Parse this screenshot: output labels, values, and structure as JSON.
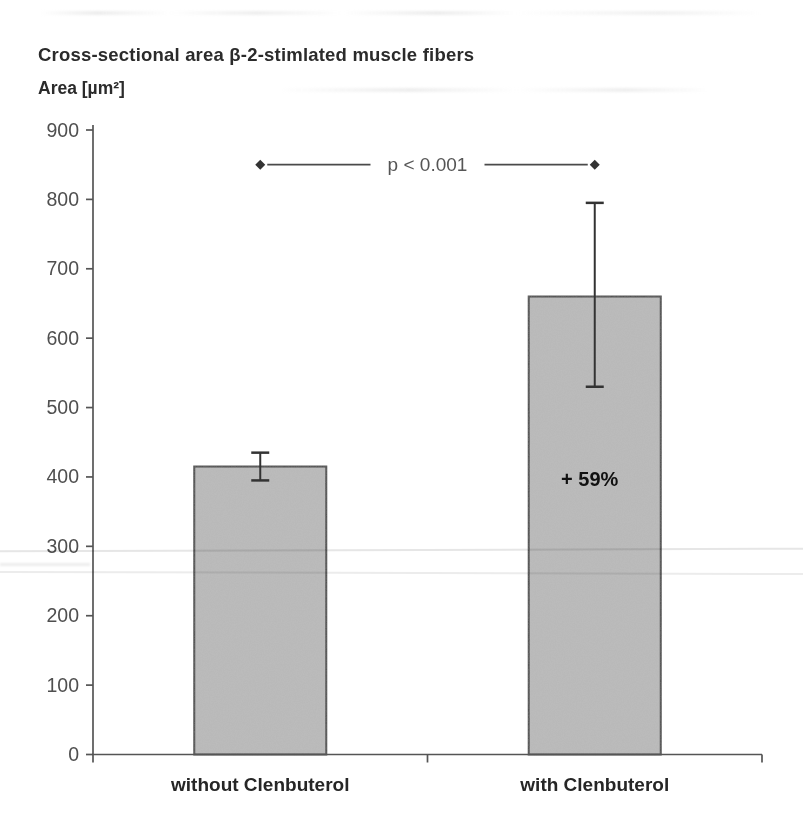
{
  "page": {
    "background": "#ffffff"
  },
  "chart_data": {
    "type": "bar",
    "title": "Cross-sectional area β-2-stimlated muscle fibers",
    "ylabel": "Area [µm²]",
    "xlabel": "",
    "categories": [
      "without Clenbuterol",
      "with Clenbuterol"
    ],
    "values": [
      415,
      660
    ],
    "error_bars": [
      {
        "upper": 435,
        "lower": 395
      },
      {
        "upper": 795,
        "lower": 530
      }
    ],
    "ylim": [
      0,
      900
    ],
    "yticks": [
      0,
      100,
      200,
      300,
      400,
      500,
      600,
      700,
      800,
      900
    ],
    "grid": false,
    "legend": false,
    "annotations": {
      "significance": {
        "text": "p < 0.001",
        "from_category": "without Clenbuterol",
        "to_category": "with Clenbuterol",
        "y_value": 850,
        "marker": "diamond"
      },
      "bar_label": {
        "text": "+ 59%",
        "category": "with Clenbuterol",
        "y_value": 395
      }
    },
    "colors": {
      "bar_fill": "#bdbdbd",
      "bar_border": "#4a4a4a",
      "axis": "#555555",
      "tick_label": "#4f4f4f",
      "title_text": "#2b2b2b",
      "category_label": "#262626",
      "annotation_text": "#555555",
      "error_bar": "#333333",
      "bar_label_text": "#111111"
    }
  }
}
